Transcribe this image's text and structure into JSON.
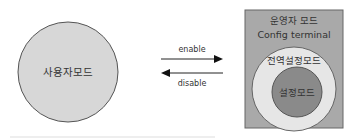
{
  "user_mode": {
    "label": "사용자모드",
    "fill": "#d7d7d7",
    "stroke": "#555555"
  },
  "arrows": {
    "enable": {
      "label": "enable",
      "direction": "right"
    },
    "disable": {
      "label": "disable",
      "direction": "left"
    }
  },
  "privileged_box": {
    "title": "운영자 모드",
    "subtitle": "Config terminal",
    "fill": "#a9a9a9",
    "stroke": "#666666"
  },
  "global_config": {
    "label": "전역설정모드",
    "fill": "#e6e6e6"
  },
  "config_mode": {
    "label": "설정모드",
    "fill": "#8a8a8a"
  },
  "colors": {
    "line": "#222222",
    "divider": "#e8e8e8"
  }
}
